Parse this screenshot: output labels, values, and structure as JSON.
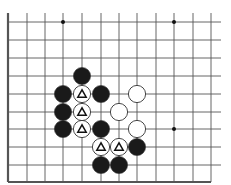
{
  "diagram": {
    "type": "go-board-fragment",
    "grid": {
      "x": [
        8,
        27,
        45,
        63,
        82,
        101,
        119,
        137,
        156,
        174,
        193,
        211
      ],
      "y": [
        22,
        40,
        58,
        76,
        94,
        112,
        129,
        147,
        165,
        182
      ],
      "line_top": 13,
      "line_right": 221,
      "left_edge_thick": true,
      "bottom_edge_thick": true
    },
    "colors": {
      "line": "#555555",
      "black_stone": "#1a1a1a",
      "white_stone": "#ffffff",
      "stone_outline": "#333333"
    },
    "stone_radius": 8.6,
    "star_points": [
      {
        "col": 3,
        "row": 0
      },
      {
        "col": 9,
        "row": 0
      },
      {
        "col": 9,
        "row": 6
      }
    ],
    "stones": [
      {
        "col": 4,
        "row": 3,
        "color": "black"
      },
      {
        "col": 3,
        "row": 4,
        "color": "black"
      },
      {
        "col": 4,
        "row": 4,
        "color": "white",
        "mark": "triangle"
      },
      {
        "col": 5,
        "row": 4,
        "color": "black"
      },
      {
        "col": 7,
        "row": 4,
        "color": "white"
      },
      {
        "col": 3,
        "row": 5,
        "color": "black"
      },
      {
        "col": 4,
        "row": 5,
        "color": "white",
        "mark": "triangle"
      },
      {
        "col": 6,
        "row": 5,
        "color": "white"
      },
      {
        "col": 3,
        "row": 6,
        "color": "black"
      },
      {
        "col": 4,
        "row": 6,
        "color": "white",
        "mark": "triangle"
      },
      {
        "col": 5,
        "row": 6,
        "color": "black"
      },
      {
        "col": 7,
        "row": 6,
        "color": "white"
      },
      {
        "col": 5,
        "row": 7,
        "color": "white",
        "mark": "triangle"
      },
      {
        "col": 6,
        "row": 7,
        "color": "white",
        "mark": "triangle"
      },
      {
        "col": 7,
        "row": 7,
        "color": "black"
      },
      {
        "col": 5,
        "row": 8,
        "color": "black"
      },
      {
        "col": 6,
        "row": 8,
        "color": "black"
      }
    ]
  }
}
